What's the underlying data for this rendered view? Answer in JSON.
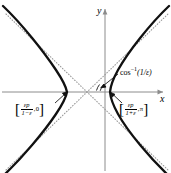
{
  "figure": {
    "name": "hyperbola-conic-section",
    "type": "hyperbola"
  },
  "axes": {
    "x_label": "x",
    "y_label": "y",
    "origin_x_px": 105,
    "origin_y_px": 92,
    "axis_color": "#808080"
  },
  "curve": {
    "color": "#000000",
    "width_px": 2.2,
    "left_vertex_px": 67,
    "right_vertex_px": 110
  },
  "asymptotes": {
    "color": "#999999",
    "style": "dotted",
    "width_px": 1
  },
  "labels": {
    "left_vertex": {
      "open_bracket": "[",
      "numerator": "εp",
      "denominator": "1−ε",
      "comma": ",",
      "angle": "0",
      "close_bracket": "]"
    },
    "right_vertex": {
      "open_bracket": "[",
      "numerator": "εp",
      "denominator": "1+ε",
      "comma": ",",
      "angle": "π",
      "close_bracket": "]"
    },
    "asymptote_angle": {
      "fn": "cos",
      "exponent": "−1",
      "arg": "(1/ε)"
    }
  }
}
